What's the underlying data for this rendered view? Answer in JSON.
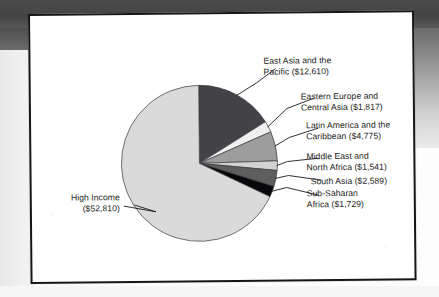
{
  "figure": {
    "frame_color": "#16161a",
    "page_color": "#ffffff"
  },
  "chart_data": {
    "type": "pie",
    "title": "",
    "subtitle": "",
    "xlabel": "",
    "ylabel": "",
    "legend_position": "callout-labels",
    "units": "US dollars",
    "start_angle_deg": 0,
    "direction": "clockwise",
    "total": 77871,
    "categories": [
      "East Asia and the Pacific",
      "Eastern Europe and Central Asia",
      "Latin America and the Caribbean",
      "Middle East and North Africa",
      "South Asia",
      "Sub-Saharan Africa",
      "High Income"
    ],
    "values": [
      12610,
      1817,
      4775,
      1541,
      2589,
      1729,
      52810
    ],
    "value_labels": [
      "$12,610",
      "$1,817",
      "$4,775",
      "$1,541",
      "$2,589",
      "$1,729",
      "$52,810"
    ],
    "colors": [
      "#434347",
      "#efefef",
      "#9d9d9d",
      "#d2d2d2",
      "#5e5e5e",
      "#08080a",
      "#dadada"
    ],
    "slices": [
      {
        "name": "East Asia and the Pacific",
        "value": 12610,
        "value_label": "$12,610",
        "color": "#434347",
        "start_deg": 0,
        "end_deg": 58.3,
        "label_line1": "East Asia and the",
        "label_line2": "Pacific ($12,610)"
      },
      {
        "name": "Eastern Europe and Central Asia",
        "value": 1817,
        "value_label": "$1,817",
        "color": "#efefef",
        "start_deg": 58.3,
        "end_deg": 66.7,
        "label_line1": "Eastern Europe and",
        "label_line2": "Central Asia ($1,817)"
      },
      {
        "name": "Latin America and the Caribbean",
        "value": 4775,
        "value_label": "$4,775",
        "color": "#9d9d9d",
        "start_deg": 66.7,
        "end_deg": 88.7,
        "label_line1": "Latin America and the",
        "label_line2": "Caribbean ($4,775)"
      },
      {
        "name": "Middle East and North Africa",
        "value": 1541,
        "value_label": "$1,541",
        "color": "#d2d2d2",
        "start_deg": 88.7,
        "end_deg": 95.8,
        "label_line1": "Middle East and",
        "label_line2": "North Africa ($1,541)"
      },
      {
        "name": "South Asia",
        "value": 2589,
        "value_label": "$2,589",
        "color": "#5e5e5e",
        "start_deg": 95.8,
        "end_deg": 107.8,
        "label_line1": "South Asia ($2,589)",
        "label_line2": ""
      },
      {
        "name": "Sub-Saharan Africa",
        "value": 1729,
        "value_label": "$1,729",
        "color": "#08080a",
        "start_deg": 107.8,
        "end_deg": 115.8,
        "label_line1": "Sub-Saharan",
        "label_line2": "Africa ($1,729)"
      },
      {
        "name": "High Income",
        "value": 52810,
        "value_label": "$52,810",
        "color": "#dadada",
        "start_deg": 115.8,
        "end_deg": 360,
        "label_line1": "High Income",
        "label_line2": "($52,810)"
      }
    ]
  }
}
